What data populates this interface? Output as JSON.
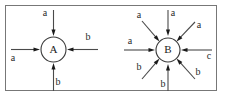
{
  "figure": {
    "type": "diagram",
    "kind": "directed-graph-incoming-edges",
    "background_color": "#ffffff",
    "frame": {
      "visible": true,
      "color": "#777777",
      "x": 5.5,
      "y": 5.5,
      "width": 211,
      "height": 85
    },
    "nodes": [
      {
        "id": "A",
        "label": "A",
        "cx": 53.5,
        "cy": 49.5,
        "r": 12.5,
        "fill": "#ffffff",
        "stroke": "#3a3a3a"
      },
      {
        "id": "B",
        "label": "B",
        "cx": 168,
        "cy": 50,
        "r": 12,
        "fill": "#ffffff",
        "stroke": "#3a3a3a"
      }
    ],
    "edges": [
      {
        "node": "A",
        "name": "edge-a-top",
        "label": "a",
        "direction": "incoming",
        "angle_deg": 90,
        "start": {
          "x": 53.5,
          "y": 10
        },
        "end": {
          "x": 53.5,
          "y": 36
        },
        "label_pos": {
          "x": 45,
          "y": 14
        }
      },
      {
        "node": "A",
        "name": "edge-a-left",
        "label": "a",
        "direction": "incoming",
        "angle_deg": 180,
        "start": {
          "x": 11,
          "y": 49.5
        },
        "end": {
          "x": 40,
          "y": 49.5
        },
        "label_pos": {
          "x": 13,
          "y": 59
        }
      },
      {
        "node": "A",
        "name": "edge-b-right",
        "label": "b",
        "direction": "incoming",
        "angle_deg": 0,
        "start": {
          "x": 98,
          "y": 49.5
        },
        "end": {
          "x": 67,
          "y": 49.5
        },
        "label_pos": {
          "x": 88,
          "y": 38
        }
      },
      {
        "node": "A",
        "name": "edge-b-bottom",
        "label": "b",
        "direction": "incoming",
        "angle_deg": 270,
        "start": {
          "x": 53.5,
          "y": 91
        },
        "end": {
          "x": 53.5,
          "y": 63
        },
        "label_pos": {
          "x": 58,
          "y": 83
        }
      },
      {
        "node": "B",
        "name": "edge-a-top",
        "label": "a",
        "direction": "incoming",
        "angle_deg": 90,
        "start": {
          "x": 168,
          "y": 10
        },
        "end": {
          "x": 168,
          "y": 36
        },
        "label_pos": {
          "x": 173,
          "y": 14
        }
      },
      {
        "node": "B",
        "name": "edge-a-topleft",
        "label": "a",
        "direction": "incoming",
        "angle_deg": 135,
        "start": {
          "x": 142,
          "y": 21
        },
        "end": {
          "x": 159.5,
          "y": 41.5
        },
        "label_pos": {
          "x": 139,
          "y": 16
        }
      },
      {
        "node": "B",
        "name": "edge-a-topright",
        "label": "a",
        "direction": "incoming",
        "angle_deg": 45,
        "start": {
          "x": 195,
          "y": 22
        },
        "end": {
          "x": 176.5,
          "y": 41.5
        },
        "label_pos": {
          "x": 199,
          "y": 26
        }
      },
      {
        "node": "B",
        "name": "edge-a-left",
        "label": "a",
        "direction": "incoming",
        "angle_deg": 180,
        "start": {
          "x": 124,
          "y": 50
        },
        "end": {
          "x": 155,
          "y": 50
        },
        "label_pos": {
          "x": 130,
          "y": 42
        }
      },
      {
        "node": "B",
        "name": "edge-c-right",
        "label": "c",
        "direction": "incoming",
        "angle_deg": 0,
        "start": {
          "x": 212,
          "y": 50
        },
        "end": {
          "x": 181,
          "y": 50
        },
        "label_pos": {
          "x": 209,
          "y": 57
        }
      },
      {
        "node": "B",
        "name": "edge-b-bottomleft",
        "label": "b",
        "direction": "incoming",
        "angle_deg": 225,
        "start": {
          "x": 142,
          "y": 79
        },
        "end": {
          "x": 159.5,
          "y": 58.5
        },
        "label_pos": {
          "x": 139,
          "y": 68
        }
      },
      {
        "node": "B",
        "name": "edge-b-bottom",
        "label": "b",
        "direction": "incoming",
        "angle_deg": 270,
        "start": {
          "x": 168,
          "y": 91
        },
        "end": {
          "x": 168,
          "y": 64
        },
        "label_pos": {
          "x": 163,
          "y": 85
        }
      },
      {
        "node": "B",
        "name": "edge-b-bottomright",
        "label": "b",
        "direction": "incoming",
        "angle_deg": 315,
        "start": {
          "x": 195,
          "y": 79
        },
        "end": {
          "x": 176.5,
          "y": 58.5
        },
        "label_pos": {
          "x": 198,
          "y": 73
        }
      }
    ]
  }
}
